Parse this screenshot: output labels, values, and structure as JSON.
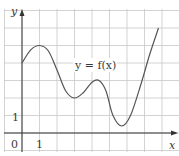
{
  "chart_data": {
    "type": "line",
    "title": "",
    "xlabel": "x",
    "ylabel": "y",
    "curve_label": "y = f(x)",
    "origin_label": "0",
    "x_tick_labels": [
      "1"
    ],
    "y_tick_labels": [
      "1"
    ],
    "grid": true,
    "xlim": [
      -1,
      9
    ],
    "ylim": [
      -1,
      7
    ],
    "series": [
      {
        "name": "y = f(x)",
        "x": [
          0,
          0.5,
          1,
          1.5,
          2,
          2.5,
          3,
          3.5,
          4,
          4.4,
          4.8,
          5.2,
          5.7,
          6.2,
          6.8,
          7.3,
          7.8
        ],
        "y": [
          4.0,
          4.75,
          5.0,
          4.7,
          3.6,
          2.4,
          2.0,
          2.3,
          2.9,
          3.0,
          2.4,
          1.0,
          0.4,
          1.0,
          2.8,
          4.5,
          6.0
        ]
      }
    ]
  },
  "colors": {
    "grid": "#c8c8c8",
    "axis": "#333333",
    "curve": "#555555"
  }
}
